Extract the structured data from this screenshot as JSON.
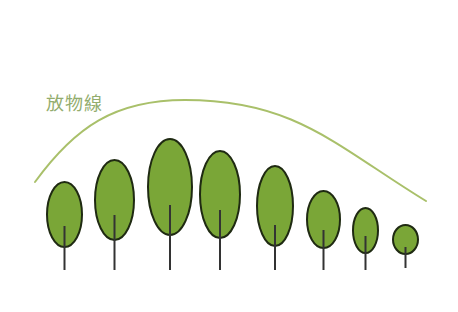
{
  "diagram": {
    "label": "放物線",
    "colors": {
      "foliage_fill": "#7aa637",
      "outline": "#1f2a12",
      "trunk": "#333333",
      "curve": "#a9c06a",
      "label": "#93ad6e"
    },
    "curve": {
      "start": [
        35,
        182
      ],
      "peak": [
        185,
        100
      ],
      "end": [
        426,
        201
      ]
    },
    "trees": [
      {
        "cx": 64.5,
        "cy": 214.5,
        "rx": 17.5,
        "ry": 32.5,
        "trunk_top": 226,
        "trunk_bottom": 270
      },
      {
        "cx": 114.5,
        "cy": 200,
        "rx": 19.5,
        "ry": 40,
        "trunk_top": 215,
        "trunk_bottom": 270
      },
      {
        "cx": 170,
        "cy": 187,
        "rx": 22,
        "ry": 48,
        "trunk_top": 205,
        "trunk_bottom": 270
      },
      {
        "cx": 220,
        "cy": 194.5,
        "rx": 20,
        "ry": 43.5,
        "trunk_top": 210,
        "trunk_bottom": 270
      },
      {
        "cx": 275,
        "cy": 206,
        "rx": 18,
        "ry": 40,
        "trunk_top": 225,
        "trunk_bottom": 270
      },
      {
        "cx": 323.5,
        "cy": 219.5,
        "rx": 16.5,
        "ry": 28.5,
        "trunk_top": 230,
        "trunk_bottom": 270
      },
      {
        "cx": 365.5,
        "cy": 230.5,
        "rx": 12.5,
        "ry": 22.5,
        "trunk_top": 236,
        "trunk_bottom": 270
      },
      {
        "cx": 405.5,
        "cy": 239.5,
        "rx": 12.5,
        "ry": 14.5,
        "trunk_top": 247,
        "trunk_bottom": 268
      }
    ]
  }
}
